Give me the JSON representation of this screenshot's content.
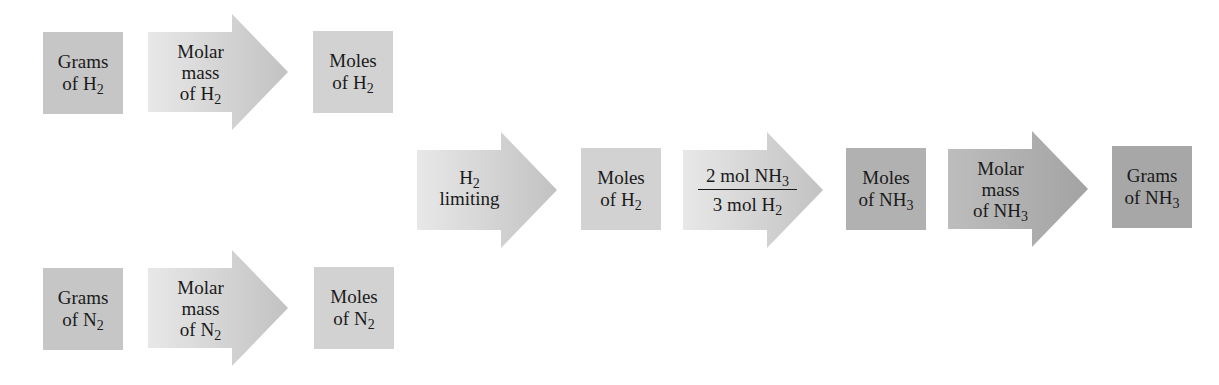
{
  "colors": {
    "box_light": "#d2d2d2",
    "box_medium": "#c6c6c6",
    "box_dark": "#b1b1b1",
    "box_darker": "#a7a7a7",
    "arrow_light_start": "#e6e6e6",
    "arrow_light_end": "#c4c4c4",
    "arrow_dark_start": "#bcbcbc",
    "arrow_dark_end": "#a4a4a4",
    "text": "#1a1a1a"
  },
  "row_h2": {
    "grams": {
      "line1": "Grams",
      "line2": "of H",
      "sub": "2"
    },
    "molar_mass": {
      "line1": "Molar",
      "line2": "mass",
      "line3": "of H",
      "sub": "2"
    },
    "moles": {
      "line1": "Moles",
      "line2": "of H",
      "sub": "2"
    }
  },
  "row_n2": {
    "grams": {
      "line1": "Grams",
      "line2": "of N",
      "sub": "2"
    },
    "molar_mass": {
      "line1": "Molar",
      "line2": "mass",
      "line3": "of N",
      "sub": "2"
    },
    "moles": {
      "line1": "Moles",
      "line2": "of N",
      "sub": "2"
    }
  },
  "main_path": {
    "limiting": {
      "line1": "H",
      "sub": "2",
      "line2": "limiting"
    },
    "moles_h2": {
      "line1": "Moles",
      "line2": "of H",
      "sub": "2"
    },
    "mole_ratio": {
      "num": "2 mol NH",
      "num_sub": "3",
      "den": "3 mol H",
      "den_sub": "2"
    },
    "moles_nh3": {
      "line1": "Moles",
      "line2": "of NH",
      "sub": "3"
    },
    "molar_mass_nh3": {
      "line1": "Molar",
      "line2": "mass",
      "line3": "of NH",
      "sub": "3"
    },
    "grams_nh3": {
      "line1": "Grams",
      "line2": "of NH",
      "sub": "3"
    }
  }
}
